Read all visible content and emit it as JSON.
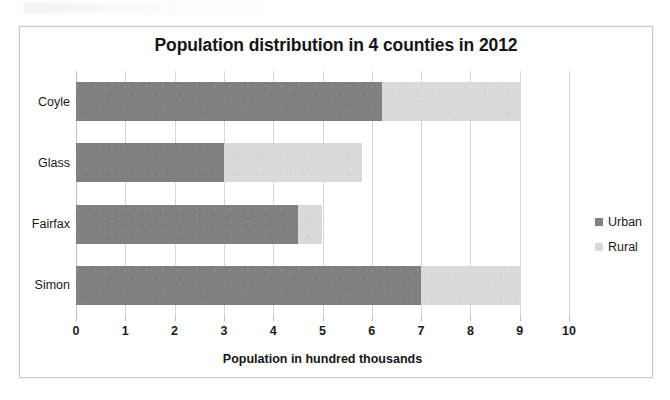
{
  "chart_data": {
    "type": "bar",
    "orientation": "horizontal",
    "stacked": true,
    "title": "Population distribution in 4 counties in 2012",
    "xlabel": "Population in hundred thousands",
    "ylabel": "",
    "categories": [
      "Coyle",
      "Glass",
      "Fairfax",
      "Simon"
    ],
    "series": [
      {
        "name": "Urban",
        "color": "#808080",
        "values": [
          6.2,
          3.0,
          4.5,
          7.0
        ]
      },
      {
        "name": "Rural",
        "color": "#d8d9d9",
        "values": [
          2.8,
          2.8,
          0.5,
          2.0
        ]
      }
    ],
    "totals": [
      9.0,
      5.8,
      5.0,
      9.0
    ],
    "xlim": [
      0,
      10
    ],
    "xticks": [
      0,
      1,
      2,
      3,
      4,
      5,
      6,
      7,
      8,
      9,
      10
    ],
    "xtick_labels": [
      "0",
      "1",
      "2",
      "3",
      "4",
      "5",
      "6",
      "7",
      "8",
      "9",
      "10"
    ],
    "grid": "vertical",
    "legend_position": "right",
    "legend_entries": [
      "Urban",
      "Rural"
    ]
  },
  "frame": {
    "border_color": "#c9cbcc",
    "background": "#ffffff"
  }
}
